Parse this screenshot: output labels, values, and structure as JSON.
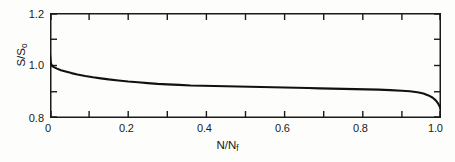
{
  "figure": {
    "background_color": "#ffffff",
    "line_color": "#111111",
    "axis_color": "#1a1a1a"
  },
  "axes": {
    "x_title_prefix": "N/N",
    "x_title_sub": "f",
    "y_title_prefix": "S/S",
    "y_title_sub": "o",
    "x_tick_labels": [
      "0",
      "0.2",
      "0.4",
      "0.6",
      "0.8",
      "1.0"
    ],
    "y_tick_labels": [
      "1.2",
      "1.0",
      "0.8"
    ]
  },
  "chart_data": {
    "type": "line",
    "title": "",
    "xlabel": "N/Nf",
    "ylabel": "S/So",
    "xlim": [
      0.0,
      1.0
    ],
    "ylim": [
      0.8,
      1.2
    ],
    "grid": false,
    "legend": null,
    "x_major_ticks": [
      0.0,
      0.2,
      0.4,
      0.6,
      0.8,
      1.0
    ],
    "x_minor_ticks": [
      0.1,
      0.3,
      0.5,
      0.7,
      0.9
    ],
    "y_major_ticks": [
      0.8,
      1.0,
      1.2
    ],
    "y_minor_ticks": [
      0.9,
      1.1
    ],
    "series": [
      {
        "name": "normalized stiffness degradation",
        "x": [
          0.0,
          0.002,
          0.005,
          0.01,
          0.018,
          0.028,
          0.04,
          0.055,
          0.07,
          0.09,
          0.11,
          0.13,
          0.15,
          0.175,
          0.2,
          0.225,
          0.25,
          0.275,
          0.3,
          0.33,
          0.36,
          0.39,
          0.42,
          0.45,
          0.48,
          0.51,
          0.54,
          0.57,
          0.6,
          0.63,
          0.66,
          0.69,
          0.72,
          0.75,
          0.78,
          0.81,
          0.84,
          0.87,
          0.9,
          0.92,
          0.94,
          0.955,
          0.968,
          0.978,
          0.986,
          0.992,
          0.996,
          0.999,
          1.0
        ],
        "y": [
          1.04,
          1.01,
          0.999,
          0.994,
          0.988,
          0.982,
          0.977,
          0.971,
          0.966,
          0.96,
          0.955,
          0.951,
          0.947,
          0.943,
          0.939,
          0.936,
          0.933,
          0.93,
          0.928,
          0.926,
          0.924,
          0.923,
          0.922,
          0.921,
          0.92,
          0.919,
          0.918,
          0.917,
          0.916,
          0.915,
          0.914,
          0.913,
          0.912,
          0.911,
          0.91,
          0.909,
          0.908,
          0.906,
          0.904,
          0.902,
          0.898,
          0.893,
          0.886,
          0.878,
          0.868,
          0.857,
          0.846,
          0.835,
          0.828
        ]
      }
    ]
  }
}
